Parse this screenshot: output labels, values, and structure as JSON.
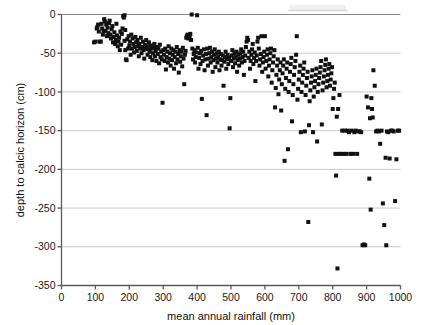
{
  "chart_data": {
    "type": "scatter",
    "title": "",
    "xlabel": "mean annual rainfall (mm)",
    "ylabel": "depth to calcic horizon (cm)",
    "xlim": [
      0,
      1000
    ],
    "ylim": [
      -350,
      0
    ],
    "xticks": [
      0,
      100,
      200,
      300,
      400,
      500,
      600,
      700,
      800,
      900,
      1000
    ],
    "yticks": [
      0,
      -50,
      -100,
      -150,
      -200,
      -250,
      -300,
      -350
    ],
    "xtick_labels": [
      "0",
      "100",
      "200",
      "300",
      "400",
      "500",
      "600",
      "700",
      "800",
      "900",
      "1000"
    ],
    "ytick_labels": [
      "0",
      "-50",
      "-100",
      "-150",
      "-200",
      "-250",
      "-300",
      "-350"
    ],
    "grid": true,
    "grid_axis": "y",
    "legend": null,
    "marker": "square",
    "marker_color": "#111111",
    "marker_size": 4,
    "n_points": 397,
    "points": [
      [
        96,
        -36
      ],
      [
        100,
        -35
      ],
      [
        104,
        -18
      ],
      [
        106,
        -16
      ],
      [
        108,
        -13
      ],
      [
        110,
        -22
      ],
      [
        112,
        -35
      ],
      [
        116,
        -35
      ],
      [
        118,
        -12
      ],
      [
        120,
        -18
      ],
      [
        122,
        -26
      ],
      [
        124,
        -22
      ],
      [
        126,
        -6
      ],
      [
        128,
        -9
      ],
      [
        130,
        -21
      ],
      [
        132,
        -13
      ],
      [
        134,
        -28
      ],
      [
        136,
        -17
      ],
      [
        138,
        -24
      ],
      [
        140,
        -11
      ],
      [
        142,
        -8
      ],
      [
        144,
        -26
      ],
      [
        146,
        -31
      ],
      [
        148,
        -19
      ],
      [
        150,
        -15
      ],
      [
        152,
        -36
      ],
      [
        154,
        -29
      ],
      [
        156,
        -23
      ],
      [
        158,
        -38
      ],
      [
        160,
        -33
      ],
      [
        162,
        -12
      ],
      [
        164,
        -27
      ],
      [
        166,
        -41
      ],
      [
        168,
        -35
      ],
      [
        170,
        -30
      ],
      [
        172,
        -46
      ],
      [
        174,
        -22
      ],
      [
        176,
        -39
      ],
      [
        178,
        -25
      ],
      [
        180,
        -18
      ],
      [
        182,
        -2
      ],
      [
        184,
        -4
      ],
      [
        186,
        -1
      ],
      [
        186,
        -34
      ],
      [
        188,
        -20
      ],
      [
        188,
        -46
      ],
      [
        190,
        -58
      ],
      [
        192,
        -59
      ],
      [
        194,
        -32
      ],
      [
        196,
        -44
      ],
      [
        198,
        -28
      ],
      [
        200,
        -40
      ],
      [
        202,
        -35
      ],
      [
        204,
        -52
      ],
      [
        206,
        -26
      ],
      [
        208,
        -44
      ],
      [
        210,
        -31
      ],
      [
        212,
        -38
      ],
      [
        214,
        -49
      ],
      [
        216,
        -42
      ],
      [
        218,
        -29
      ],
      [
        220,
        -36
      ],
      [
        222,
        -47
      ],
      [
        224,
        -33
      ],
      [
        226,
        -41
      ],
      [
        228,
        -54
      ],
      [
        230,
        -38
      ],
      [
        232,
        -44
      ],
      [
        234,
        -30
      ],
      [
        236,
        -50
      ],
      [
        238,
        -42
      ],
      [
        240,
        -35
      ],
      [
        242,
        -46
      ],
      [
        244,
        -57
      ],
      [
        246,
        -39
      ],
      [
        248,
        -44
      ],
      [
        250,
        -33
      ],
      [
        252,
        -41
      ],
      [
        254,
        -52
      ],
      [
        256,
        -45
      ],
      [
        258,
        -36
      ],
      [
        260,
        -48
      ],
      [
        262,
        -55
      ],
      [
        264,
        -40
      ],
      [
        266,
        -44
      ],
      [
        268,
        -59
      ],
      [
        270,
        -50
      ],
      [
        272,
        -43
      ],
      [
        274,
        -38
      ],
      [
        276,
        -54
      ],
      [
        278,
        -47
      ],
      [
        280,
        -60
      ],
      [
        282,
        -42
      ],
      [
        284,
        -51
      ],
      [
        286,
        -44
      ],
      [
        288,
        -63
      ],
      [
        290,
        -39
      ],
      [
        292,
        -55
      ],
      [
        294,
        -48
      ],
      [
        296,
        -58
      ],
      [
        298,
        -114
      ],
      [
        300,
        -46
      ],
      [
        302,
        -52
      ],
      [
        304,
        -60
      ],
      [
        306,
        -44
      ],
      [
        308,
        -71
      ],
      [
        310,
        -55
      ],
      [
        312,
        -48
      ],
      [
        314,
        -62
      ],
      [
        316,
        -41
      ],
      [
        318,
        -57
      ],
      [
        320,
        -50
      ],
      [
        322,
        -66
      ],
      [
        324,
        -44
      ],
      [
        326,
        -59
      ],
      [
        328,
        -52
      ],
      [
        330,
        -46
      ],
      [
        332,
        -70
      ],
      [
        334,
        -55
      ],
      [
        336,
        -48
      ],
      [
        338,
        -63
      ],
      [
        340,
        -42
      ],
      [
        342,
        -58
      ],
      [
        344,
        -51
      ],
      [
        346,
        -75
      ],
      [
        348,
        -46
      ],
      [
        350,
        -61
      ],
      [
        352,
        -54
      ],
      [
        354,
        -48
      ],
      [
        356,
        -67
      ],
      [
        358,
        -43
      ],
      [
        360,
        -57
      ],
      [
        362,
        -90
      ],
      [
        364,
        -52
      ],
      [
        366,
        -47
      ],
      [
        368,
        -30
      ],
      [
        370,
        -28
      ],
      [
        372,
        -26
      ],
      [
        374,
        -31
      ],
      [
        376,
        -27
      ],
      [
        378,
        -29
      ],
      [
        380,
        -25
      ],
      [
        382,
        -33
      ],
      [
        384,
        0
      ],
      [
        386,
        -44
      ],
      [
        388,
        -58
      ],
      [
        390,
        -51
      ],
      [
        392,
        -46
      ],
      [
        394,
        -62
      ],
      [
        396,
        -55
      ],
      [
        398,
        -49
      ],
      [
        400,
        -1
      ],
      [
        402,
        -43
      ],
      [
        404,
        -70
      ],
      [
        406,
        -56
      ],
      [
        408,
        -50
      ],
      [
        410,
        -64
      ],
      [
        412,
        -47
      ],
      [
        414,
        -109
      ],
      [
        416,
        -60
      ],
      [
        418,
        -53
      ],
      [
        420,
        -45
      ],
      [
        422,
        -72
      ],
      [
        424,
        -58
      ],
      [
        426,
        -51
      ],
      [
        428,
        -130
      ],
      [
        430,
        -44
      ],
      [
        432,
        -66
      ],
      [
        434,
        -57
      ],
      [
        436,
        -50
      ],
      [
        438,
        -43
      ],
      [
        440,
        -62
      ],
      [
        442,
        -55
      ],
      [
        444,
        -48
      ],
      [
        446,
        -74
      ],
      [
        448,
        -59
      ],
      [
        450,
        -52
      ],
      [
        452,
        -45
      ],
      [
        454,
        -68
      ],
      [
        456,
        -57
      ],
      [
        458,
        -50
      ],
      [
        460,
        -62
      ],
      [
        462,
        -55
      ],
      [
        464,
        -48
      ],
      [
        466,
        -72
      ],
      [
        468,
        -58
      ],
      [
        470,
        -51
      ],
      [
        472,
        -66
      ],
      [
        474,
        -59
      ],
      [
        476,
        -53
      ],
      [
        478,
        -92
      ],
      [
        480,
        -61
      ],
      [
        482,
        -55
      ],
      [
        484,
        -48
      ],
      [
        486,
        -70
      ],
      [
        488,
        -58
      ],
      [
        490,
        -52
      ],
      [
        492,
        -64
      ],
      [
        494,
        -56
      ],
      [
        496,
        -147
      ],
      [
        498,
        -108
      ],
      [
        500,
        -60
      ],
      [
        502,
        -53
      ],
      [
        504,
        -46
      ],
      [
        506,
        -68
      ],
      [
        508,
        -57
      ],
      [
        510,
        -50
      ],
      [
        512,
        -63
      ],
      [
        514,
        -55
      ],
      [
        516,
        -48
      ],
      [
        518,
        -74
      ],
      [
        520,
        -59
      ],
      [
        522,
        -52
      ],
      [
        524,
        -66
      ],
      [
        526,
        -57
      ],
      [
        528,
        -50
      ],
      [
        530,
        -45
      ],
      [
        532,
        -62
      ],
      [
        534,
        -55
      ],
      [
        536,
        -48
      ],
      [
        538,
        -78
      ],
      [
        540,
        -60
      ],
      [
        542,
        -53
      ],
      [
        544,
        -42
      ],
      [
        546,
        -35
      ],
      [
        548,
        -30
      ],
      [
        550,
        -33
      ],
      [
        552,
        -56
      ],
      [
        554,
        -48
      ],
      [
        556,
        -70
      ],
      [
        558,
        -60
      ],
      [
        560,
        -52
      ],
      [
        562,
        -45
      ],
      [
        564,
        -38
      ],
      [
        566,
        -64
      ],
      [
        568,
        -56
      ],
      [
        570,
        -49
      ],
      [
        572,
        -86
      ],
      [
        574,
        -60
      ],
      [
        576,
        -53
      ],
      [
        578,
        -35
      ],
      [
        580,
        -30
      ],
      [
        582,
        -44
      ],
      [
        584,
        -66
      ],
      [
        586,
        -58
      ],
      [
        588,
        -51
      ],
      [
        590,
        -28
      ],
      [
        592,
        -74
      ],
      [
        594,
        -62
      ],
      [
        596,
        -55
      ],
      [
        598,
        -48
      ],
      [
        600,
        -28
      ],
      [
        602,
        -70
      ],
      [
        604,
        -60
      ],
      [
        606,
        -52
      ],
      [
        608,
        -45
      ],
      [
        610,
        -80
      ],
      [
        612,
        -66
      ],
      [
        614,
        -58
      ],
      [
        616,
        -50
      ],
      [
        618,
        -44
      ],
      [
        620,
        -88
      ],
      [
        622,
        -72
      ],
      [
        624,
        -62
      ],
      [
        626,
        -54
      ],
      [
        628,
        -46
      ],
      [
        630,
        -120
      ],
      [
        632,
        -95
      ],
      [
        634,
        -78
      ],
      [
        636,
        -66
      ],
      [
        638,
        -58
      ],
      [
        640,
        -103
      ],
      [
        642,
        -84
      ],
      [
        644,
        -72
      ],
      [
        646,
        -62
      ],
      [
        648,
        -124
      ],
      [
        650,
        -90
      ],
      [
        652,
        -76
      ],
      [
        654,
        -66
      ],
      [
        656,
        -58
      ],
      [
        658,
        -189
      ],
      [
        660,
        -96
      ],
      [
        662,
        -82
      ],
      [
        664,
        -70
      ],
      [
        666,
        -62
      ],
      [
        668,
        -174
      ],
      [
        670,
        -100
      ],
      [
        672,
        -86
      ],
      [
        674,
        -74
      ],
      [
        676,
        -64
      ],
      [
        678,
        -56
      ],
      [
        680,
        -138
      ],
      [
        682,
        -104
      ],
      [
        684,
        -90
      ],
      [
        686,
        -78
      ],
      [
        688,
        -68
      ],
      [
        690,
        -60
      ],
      [
        692,
        -52
      ],
      [
        694,
        -28
      ],
      [
        696,
        -110
      ],
      [
        698,
        -96
      ],
      [
        700,
        -84
      ],
      [
        702,
        -74
      ],
      [
        704,
        -66
      ],
      [
        706,
        -152
      ],
      [
        708,
        -100
      ],
      [
        710,
        -88
      ],
      [
        712,
        -78
      ],
      [
        714,
        -70
      ],
      [
        716,
        -62
      ],
      [
        718,
        -151
      ],
      [
        720,
        -104
      ],
      [
        722,
        -92
      ],
      [
        724,
        -82
      ],
      [
        726,
        -74
      ],
      [
        728,
        -268
      ],
      [
        730,
        -143
      ],
      [
        732,
        -112
      ],
      [
        734,
        -98
      ],
      [
        736,
        -88
      ],
      [
        738,
        -80
      ],
      [
        740,
        -72
      ],
      [
        742,
        -152
      ],
      [
        744,
        -106
      ],
      [
        746,
        -94
      ],
      [
        748,
        -86
      ],
      [
        750,
        -78
      ],
      [
        752,
        -70
      ],
      [
        754,
        -164
      ],
      [
        756,
        -100
      ],
      [
        758,
        -90
      ],
      [
        760,
        -82
      ],
      [
        762,
        -75
      ],
      [
        764,
        -68
      ],
      [
        766,
        -60
      ],
      [
        768,
        -142
      ],
      [
        770,
        -98
      ],
      [
        772,
        -88
      ],
      [
        774,
        -80
      ],
      [
        776,
        -72
      ],
      [
        778,
        -65
      ],
      [
        780,
        -58
      ],
      [
        782,
        -94
      ],
      [
        784,
        -86
      ],
      [
        786,
        -78
      ],
      [
        788,
        -70
      ],
      [
        790,
        -64
      ],
      [
        792,
        -92
      ],
      [
        794,
        -84
      ],
      [
        796,
        -76
      ],
      [
        798,
        -68
      ],
      [
        800,
        -122
      ],
      [
        802,
        -108
      ],
      [
        804,
        -96
      ],
      [
        806,
        -88
      ],
      [
        808,
        -180
      ],
      [
        810,
        -208
      ],
      [
        812,
        -132
      ],
      [
        814,
        -328
      ],
      [
        816,
        -122
      ],
      [
        818,
        -180
      ],
      [
        820,
        -104
      ],
      [
        824,
        -180
      ],
      [
        828,
        -150
      ],
      [
        832,
        -180
      ],
      [
        836,
        -150
      ],
      [
        840,
        -180
      ],
      [
        844,
        -150
      ],
      [
        848,
        -152
      ],
      [
        852,
        -180
      ],
      [
        856,
        -150
      ],
      [
        860,
        -180
      ],
      [
        864,
        -152
      ],
      [
        868,
        -150
      ],
      [
        872,
        -180
      ],
      [
        876,
        -151
      ],
      [
        880,
        -151
      ],
      [
        884,
        -152
      ],
      [
        888,
        -298
      ],
      [
        892,
        -297
      ],
      [
        896,
        -298
      ],
      [
        900,
        -106
      ],
      [
        904,
        -120
      ],
      [
        908,
        -212
      ],
      [
        910,
        -134
      ],
      [
        912,
        -252
      ],
      [
        914,
        -108
      ],
      [
        916,
        -122
      ],
      [
        918,
        -133
      ],
      [
        920,
        -72
      ],
      [
        924,
        -92
      ],
      [
        928,
        -151
      ],
      [
        932,
        -150
      ],
      [
        936,
        -151
      ],
      [
        940,
        -167
      ],
      [
        944,
        -150
      ],
      [
        948,
        -244
      ],
      [
        952,
        -272
      ],
      [
        956,
        -185
      ],
      [
        958,
        -298
      ],
      [
        960,
        -151
      ],
      [
        964,
        -152
      ],
      [
        968,
        -186
      ],
      [
        972,
        -150
      ],
      [
        976,
        -150
      ],
      [
        980,
        -151
      ],
      [
        984,
        -241
      ],
      [
        988,
        -187
      ],
      [
        992,
        -150
      ],
      [
        996,
        -150
      ]
    ]
  },
  "axes": {
    "x_title": "mean annual rainfall (mm)",
    "y_title": "depth to calcic horizon (cm)"
  }
}
